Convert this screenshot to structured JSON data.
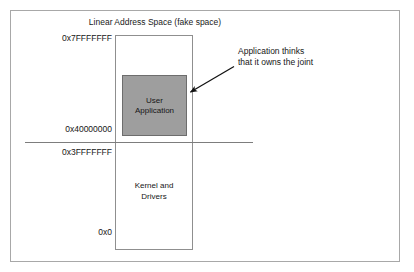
{
  "diagram": {
    "title": "Linear Address Space (fake space)",
    "address_space": {
      "labels": [
        {
          "id": "top",
          "text": "0x7FFFFFFF"
        },
        {
          "id": "mid_hi",
          "text": "0x40000000"
        },
        {
          "id": "mid_lo",
          "text": "0x3FFFFFFF"
        },
        {
          "id": "zero",
          "text": "0x0"
        }
      ],
      "regions": [
        {
          "id": "user-application",
          "line1": "User",
          "line2": "Application",
          "fill": "#9e9e9e",
          "border": "#6d6d6d"
        },
        {
          "id": "kernel-and-drivers",
          "line1": "Kernel and",
          "line2": "Drivers",
          "fill": "#ffffff",
          "border": "#8f8f8f"
        }
      ]
    },
    "annotation": {
      "line1": "Application thinks",
      "line2": "that it owns the joint",
      "arrow_color": "#111111"
    },
    "colors": {
      "frame": "#a8a8a8",
      "rect_border": "#8f8f8f",
      "divider": "#7d7d7d",
      "text": "#161616",
      "background": "#ffffff"
    }
  }
}
